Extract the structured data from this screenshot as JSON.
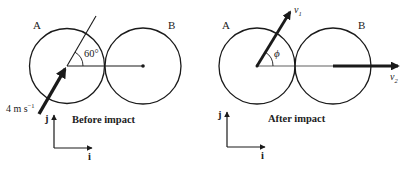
{
  "before": {
    "ball_a_label": "A",
    "ball_b_label": "B",
    "angle_label": "60°",
    "speed_label": "4 m s",
    "speed_exp": "−1",
    "caption": "Before impact",
    "axis_j": "j",
    "axis_i": "i"
  },
  "after": {
    "ball_a_label": "A",
    "ball_b_label": "B",
    "angle_label": "ϕ",
    "v1_label": "v",
    "v1_sub": "1",
    "v2_label": "v",
    "v2_sub": "2",
    "caption": "After impact",
    "axis_j": "j",
    "axis_i": "i"
  },
  "colors": {
    "ink": "#1a1a1a",
    "background": "#ffffff"
  }
}
